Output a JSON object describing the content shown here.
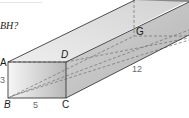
{
  "question": {
    "text": "BH?"
  },
  "figure": {
    "type": "rectangular-prism",
    "vertices": {
      "A": "A",
      "B": "B",
      "C": "C",
      "D": "D",
      "G": "G"
    },
    "dimensions": {
      "height": "3",
      "width": "5",
      "length": "12"
    },
    "colors": {
      "edge": "#3a3a3a",
      "dashed": "#6e6e6e",
      "front_face_light": "#f4f4f4",
      "front_face_dark": "#bdbdbd",
      "top_face": "#e2e2e2",
      "side_face": "#c4c4c4"
    }
  }
}
